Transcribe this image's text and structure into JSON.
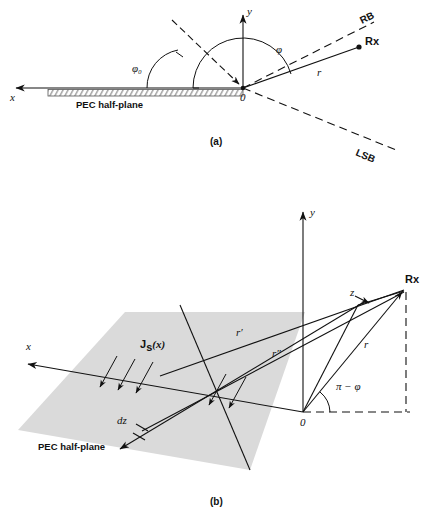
{
  "figure": {
    "panels": [
      {
        "id": "a",
        "caption": "(a)",
        "labels": {
          "x_axis": "x",
          "y_axis": "y",
          "origin": "0",
          "phi": "φ",
          "phi0": "φ₀",
          "r": "r",
          "rx": "Rx",
          "rb": "RB",
          "lsb": "LSB",
          "pec": "PEC half-plane"
        }
      },
      {
        "id": "b",
        "caption": "(b)",
        "labels": {
          "x_axis": "x",
          "y_axis": "y",
          "z_axis": "z",
          "origin": "0",
          "rx": "Rx",
          "r": "r",
          "r_prime": "r′",
          "r_double_prime": "r″",
          "angle": "π − φ",
          "current": "J",
          "current_sub": "s",
          "current_arg": "(x)",
          "dz": "dz",
          "pec": "PEC half-plane"
        }
      }
    ],
    "colors": {
      "plane_fill": "#dadada",
      "line": "#111111",
      "hatch": "#777777",
      "background": "#ffffff"
    }
  }
}
